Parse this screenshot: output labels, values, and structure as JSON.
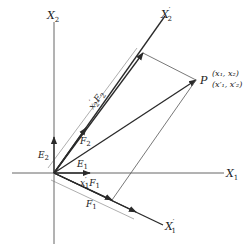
{
  "figure": {
    "type": "coordinate-transformation-diagram",
    "colors": {
      "stroke": "#2a2a2a",
      "thin": "#555555",
      "background": "#ffffff"
    }
  },
  "axes": {
    "x1": {
      "letter": "X",
      "sub": "1",
      "prime": ""
    },
    "x2": {
      "letter": "X",
      "sub": "2",
      "prime": ""
    },
    "x1p": {
      "letter": "X",
      "sub": "1",
      "prime": "′"
    },
    "x2p": {
      "letter": "X",
      "sub": "2",
      "prime": "′"
    }
  },
  "vectors": {
    "e1": {
      "letter": "E",
      "sub": "1"
    },
    "e2": {
      "letter": "E",
      "sub": "2"
    },
    "f1": {
      "letter": "F",
      "sub": "1"
    },
    "f2": {
      "letter": "F",
      "sub": "2"
    },
    "x1f1": {
      "coef": "x",
      "coef_sub": "1",
      "prime": "′",
      "letter": "F",
      "sub": "1"
    },
    "x2f2": {
      "coef": "x",
      "coef_sub": "2",
      "prime": "′",
      "letter": "F",
      "sub": "2"
    }
  },
  "point": {
    "name": "P",
    "coords_original": "(x₁, x₂)",
    "coords_primed": "(x′₁, x′₂)"
  }
}
